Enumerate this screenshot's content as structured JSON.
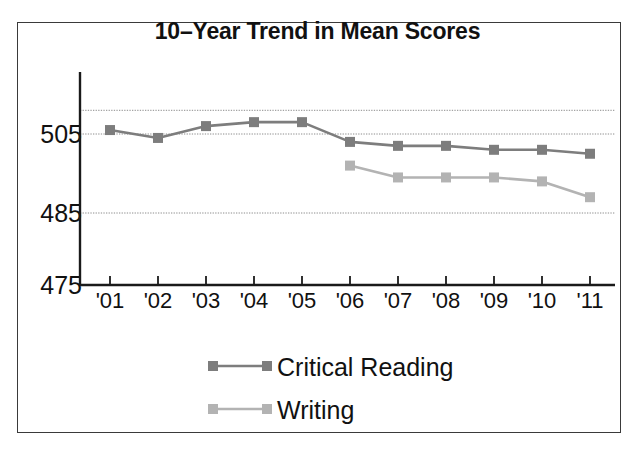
{
  "chart_data": {
    "type": "line",
    "title": "10–Year Trend in Mean Scores",
    "xlabel": "",
    "ylabel": "",
    "categories": [
      "'01",
      "'02",
      "'03",
      "'04",
      "'05",
      "'06",
      "'07",
      "'08",
      "'09",
      "'10",
      "'11"
    ],
    "ylim": [
      475,
      511
    ],
    "yticks": [
      475,
      485,
      505
    ],
    "ytick_labels": [
      "475",
      "485",
      "505"
    ],
    "gridlines": [
      485,
      505,
      511
    ],
    "grid": true,
    "legend_position": "bottom-center",
    "series": [
      {
        "name": "Critical Reading",
        "color": "#7d7d7d",
        "marker": "square",
        "x": [
          "'01",
          "'02",
          "'03",
          "'04",
          "'05",
          "'06",
          "'07",
          "'08",
          "'09",
          "'10",
          "'11"
        ],
        "values": [
          506,
          504,
          507,
          508,
          508,
          503,
          502,
          502,
          501,
          501,
          500
        ]
      },
      {
        "name": "Writing",
        "color": "#b3b3b3",
        "marker": "square",
        "x": [
          "'06",
          "'07",
          "'08",
          "'09",
          "'10",
          "'11"
        ],
        "values": [
          497,
          494,
          494,
          494,
          493,
          489
        ]
      }
    ]
  },
  "legend": {
    "items": [
      {
        "label": "Critical Reading",
        "color": "#7d7d7d"
      },
      {
        "label": "Writing",
        "color": "#b3b3b3"
      }
    ]
  },
  "axis": {
    "y_labels": [
      "505",
      "485",
      "475"
    ],
    "x_labels": [
      "'01",
      "'02",
      "'03",
      "'04",
      "'05",
      "'06",
      "'07",
      "'08",
      "'09",
      "'10",
      "'11"
    ]
  },
  "colors": {
    "critical_reading": "#7d7d7d",
    "writing": "#b3b3b3",
    "axis": "#1a1a1a",
    "grid": "#8c8c8c",
    "frame": "#3a3a3a",
    "text": "#111111",
    "background": "#ffffff"
  }
}
